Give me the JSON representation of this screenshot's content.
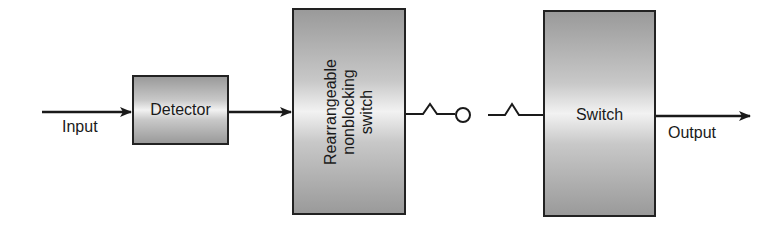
{
  "diagram": {
    "type": "block-diagram",
    "input_label": "Input",
    "output_label": "Output",
    "blocks": [
      {
        "id": "detector",
        "label": "Detector"
      },
      {
        "id": "rearrangeable",
        "lines": [
          "Rearrangeable",
          "nonblocking",
          "switch"
        ]
      },
      {
        "id": "switch",
        "label": "Switch"
      }
    ],
    "connections": [
      {
        "from": "input",
        "to": "detector",
        "style": "arrow"
      },
      {
        "from": "detector",
        "to": "rearrangeable",
        "style": "arrow"
      },
      {
        "from": "rearrangeable",
        "to": "switch",
        "style": "open-switch-contact"
      },
      {
        "from": "switch",
        "to": "output",
        "style": "arrow"
      }
    ]
  }
}
